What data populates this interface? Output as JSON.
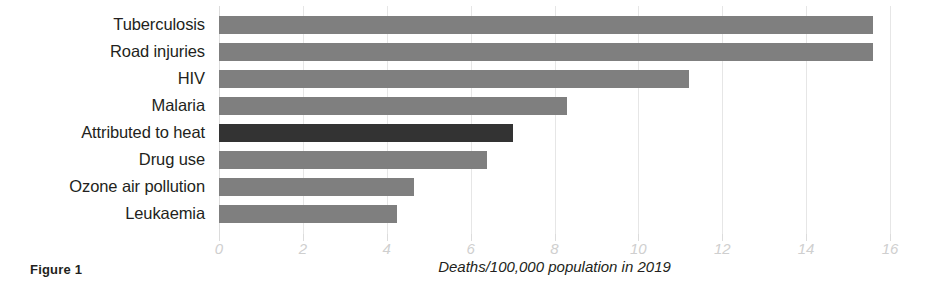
{
  "caption": "Figure 1",
  "chart_data": {
    "type": "bar",
    "orientation": "horizontal",
    "title": "",
    "xlabel": "Deaths/100,000 population in 2019",
    "ylabel": "",
    "xlim": [
      0,
      16
    ],
    "xticks": [
      0,
      2,
      4,
      6,
      8,
      10,
      12,
      14,
      16
    ],
    "xtick_labels": [
      "0",
      "2",
      "4",
      "6",
      "8",
      "10",
      "12",
      "14",
      "16"
    ],
    "grid": true,
    "legend": "none",
    "categories": [
      "Tuberculosis",
      "Road injuries",
      "HIV",
      "Malaria",
      "Attributed to heat",
      "Drug use",
      "Ozone air pollution",
      "Leukaemia"
    ],
    "values": [
      15.6,
      15.6,
      11.2,
      8.3,
      7.0,
      6.4,
      4.65,
      4.25
    ],
    "highlighted_category": "Attributed to heat",
    "colors": {
      "bar": "#7f7f7f",
      "bar_highlight": "#333333",
      "gridline": "#e6e6e6",
      "tick_label": "#cfcfcf",
      "text": "#231f20",
      "background": "#ffffff"
    }
  }
}
